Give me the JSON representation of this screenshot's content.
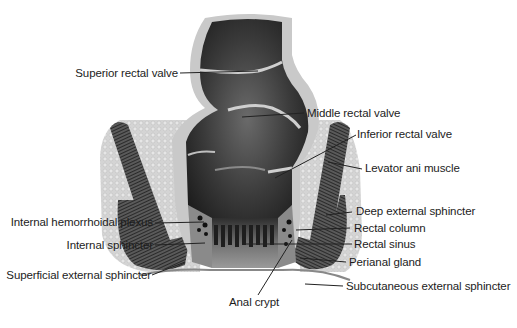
{
  "figure": {
    "colors": {
      "background": "#ffffff",
      "mucosa_dark": "#2a2a2a",
      "mucosa_mid": "#555555",
      "wall_light": "#cfcfcf",
      "fat_tissue": "#d8d8d8",
      "muscle": "#4a4a4a",
      "label_text": "#1c1c1c",
      "leader_line": "#222222"
    }
  },
  "labels": {
    "superior_rectal_valve": "Superior rectal valve",
    "middle_rectal_valve": "Middle rectal valve",
    "inferior_rectal_valve": "Inferior rectal valve",
    "levator_ani_muscle": "Levator ani muscle",
    "deep_external_sphincter": "Deep external sphincter",
    "rectal_column": "Rectal column",
    "rectal_sinus": "Rectal sinus",
    "perianal_gland": "Perianal gland",
    "subcutaneous_external_sphincter": "Subcutaneous external sphincter",
    "internal_hemorrhoidal_plexus": "Internal hemorrhoidal plexus",
    "internal_sphincter": "Internal sphincter",
    "superficial_external_sphincter": "Superficial external sphincter",
    "anal_crypt": "Anal crypt"
  }
}
